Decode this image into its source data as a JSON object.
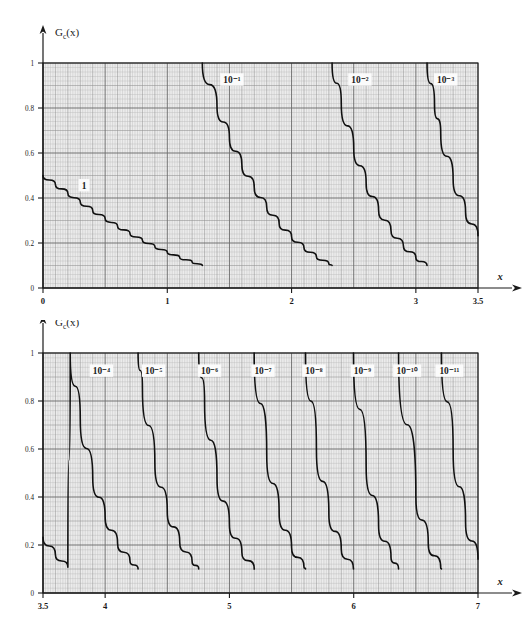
{
  "figure": {
    "kind": "nomogram",
    "background_color": "#ffffff",
    "ink_color": "#1a1a1a",
    "grid_minor_color": "#b9b9b9",
    "grid_major_color": "#6e6e6e",
    "grid_fill_color": "#ececec",
    "curve_color": "#101010",
    "axis_color": "#1a1a1a"
  },
  "panels": [
    {
      "id": "top-panel",
      "y_axis_label": "G",
      "y_axis_label_sub": "c",
      "y_axis_label_tail": "(x)",
      "x_axis_label": "x",
      "x_ticks": [
        "0",
        "1",
        "2",
        "3",
        "3.5"
      ],
      "x_tick_values": [
        0,
        1,
        2,
        3,
        3.5
      ],
      "y_ticks": [
        "0",
        "0.2",
        "0.4",
        "0.6",
        "0.8",
        "1"
      ],
      "y_tick_values": [
        0,
        0.2,
        0.4,
        0.6,
        0.8,
        1
      ],
      "x_range": [
        0,
        3.5
      ],
      "y_range": [
        0,
        1
      ],
      "curve_labels": [
        "1",
        "10⁻¹",
        "10⁻²",
        "10⁻³"
      ],
      "curve_exponents": [
        0,
        -1,
        -2,
        -3
      ]
    },
    {
      "id": "bottom-panel",
      "y_axis_label": "G",
      "y_axis_label_sub": "c",
      "y_axis_label_tail": "(x)",
      "x_axis_label": "x",
      "x_ticks": [
        "3.5",
        "4",
        "5",
        "6",
        "7"
      ],
      "x_tick_values": [
        3.5,
        4,
        5,
        6,
        7
      ],
      "y_ticks": [
        "0",
        "0.2",
        "0.4",
        "0.6",
        "0.8",
        "1"
      ],
      "y_tick_values": [
        0,
        0.2,
        0.4,
        0.6,
        0.8,
        1
      ],
      "x_range": [
        3.5,
        7
      ],
      "y_range": [
        0,
        1
      ],
      "curve_labels": [
        "10⁻⁴",
        "10⁻⁵",
        "10⁻⁶",
        "10⁻⁷",
        "10⁻⁸",
        "10⁻⁹",
        "10⁻¹⁰",
        "10⁻¹¹"
      ],
      "curve_exponents": [
        -4,
        -5,
        -6,
        -7,
        -8,
        -9,
        -10,
        -11
      ]
    }
  ],
  "chart_data": {
    "type": "line",
    "title": "",
    "xlabel": "x",
    "ylabel": "Gc(x)",
    "grid": true,
    "legend_position": "inline-on-curve",
    "panels": [
      {
        "id": "top-panel",
        "xlim": [
          0,
          3.5
        ],
        "ylim": [
          0,
          1
        ],
        "xticks": [
          0,
          1,
          2,
          3,
          3.5
        ],
        "yticks": [
          0,
          0.2,
          0.4,
          0.6,
          0.8,
          1
        ],
        "series": [
          {
            "name": "1",
            "exponent": 0,
            "label_x": 0.33,
            "label_y": 0.455,
            "points": [
              {
                "x": 0.0,
                "y": 0.5
              },
              {
                "x": 0.1,
                "y": 0.46
              },
              {
                "x": 0.2,
                "y": 0.4207
              },
              {
                "x": 0.3,
                "y": 0.3821
              },
              {
                "x": 0.4,
                "y": 0.3446
              },
              {
                "x": 0.5,
                "y": 0.3085
              },
              {
                "x": 0.6,
                "y": 0.2743
              },
              {
                "x": 0.7,
                "y": 0.242
              },
              {
                "x": 0.8,
                "y": 0.2119
              },
              {
                "x": 0.9,
                "y": 0.1841
              },
              {
                "x": 1.0,
                "y": 0.1587
              },
              {
                "x": 1.1,
                "y": 0.1357
              },
              {
                "x": 1.2,
                "y": 0.1151
              },
              {
                "x": 1.282,
                "y": 0.1
              }
            ]
          },
          {
            "name": "10^-1",
            "exponent": -1,
            "label_x": 1.52,
            "label_y": 0.925,
            "points": [
              {
                "x": 1.282,
                "y": 1.0
              },
              {
                "x": 1.4,
                "y": 0.8076
              },
              {
                "x": 1.5,
                "y": 0.6681
              },
              {
                "x": 1.6,
                "y": 0.548
              },
              {
                "x": 1.7,
                "y": 0.4457
              },
              {
                "x": 1.8,
                "y": 0.3593
              },
              {
                "x": 1.9,
                "y": 0.2872
              },
              {
                "x": 2.0,
                "y": 0.2275
              },
              {
                "x": 2.1,
                "y": 0.1786
              },
              {
                "x": 2.2,
                "y": 0.139
              },
              {
                "x": 2.3,
                "y": 0.1072
              },
              {
                "x": 2.326,
                "y": 0.1
              }
            ]
          },
          {
            "name": "10^-2",
            "exponent": -2,
            "label_x": 2.55,
            "label_y": 0.925,
            "points": [
              {
                "x": 2.326,
                "y": 1.0
              },
              {
                "x": 2.4,
                "y": 0.8198
              },
              {
                "x": 2.5,
                "y": 0.621
              },
              {
                "x": 2.6,
                "y": 0.4661
              },
              {
                "x": 2.7,
                "y": 0.3467
              },
              {
                "x": 2.8,
                "y": 0.2555
              },
              {
                "x": 2.9,
                "y": 0.1866
              },
              {
                "x": 3.0,
                "y": 0.135
              },
              {
                "x": 3.09,
                "y": 0.1
              }
            ]
          },
          {
            "name": "10^-3",
            "exponent": -3,
            "label_x": 3.24,
            "label_y": 0.925,
            "points": [
              {
                "x": 3.09,
                "y": 1.0
              },
              {
                "x": 3.15,
                "y": 0.8164
              },
              {
                "x": 3.2,
                "y": 0.6871
              },
              {
                "x": 3.3,
                "y": 0.4834
              },
              {
                "x": 3.4,
                "y": 0.3369
              },
              {
                "x": 3.5,
                "y": 0.2326
              }
            ]
          }
        ]
      },
      {
        "id": "bottom-panel",
        "xlim": [
          3.5,
          7
        ],
        "ylim": [
          0,
          1
        ],
        "xticks": [
          3.5,
          4,
          5,
          6,
          7
        ],
        "yticks": [
          0,
          0.2,
          0.4,
          0.6,
          0.8,
          1
        ],
        "series": [
          {
            "name": "10^-4",
            "exponent": -4,
            "label_x": 3.97,
            "label_y": 0.925,
            "points": [
              {
                "x": 3.5,
                "y": 0.2326
              },
              {
                "x": 3.6,
                "y": 0.1591
              },
              {
                "x": 3.7,
                "y": 0.1078
              },
              {
                "x": 3.719,
                "y": 1.0
              },
              {
                "x": 3.8,
                "y": 0.7235
              },
              {
                "x": 3.9,
                "y": 0.481
              },
              {
                "x": 4.0,
                "y": 0.3167
              },
              {
                "x": 4.1,
                "y": 0.2066
              },
              {
                "x": 4.2,
                "y": 0.1335
              },
              {
                "x": 4.265,
                "y": 0.1
              }
            ]
          },
          {
            "name": "10^-5",
            "exponent": -5,
            "label_x": 4.39,
            "label_y": 0.925,
            "points": [
              {
                "x": 4.265,
                "y": 1.0
              },
              {
                "x": 4.3,
                "y": 0.854
              },
              {
                "x": 4.4,
                "y": 0.5413
              },
              {
                "x": 4.5,
                "y": 0.3398
              },
              {
                "x": 4.6,
                "y": 0.2112
              },
              {
                "x": 4.7,
                "y": 0.1301
              },
              {
                "x": 4.753,
                "y": 0.1
              }
            ]
          },
          {
            "name": "10^-6",
            "exponent": -6,
            "label_x": 4.84,
            "label_y": 0.925,
            "points": [
              {
                "x": 4.753,
                "y": 1.0
              },
              {
                "x": 4.8,
                "y": 0.7933
              },
              {
                "x": 4.9,
                "y": 0.4792
              },
              {
                "x": 5.0,
                "y": 0.2867
              },
              {
                "x": 5.1,
                "y": 0.1698
              },
              {
                "x": 5.2,
                "y": 0.0996
              },
              {
                "x": 5.199,
                "y": 0.1
              }
            ]
          },
          {
            "name": "10^-7",
            "exponent": -7,
            "label_x": 5.27,
            "label_y": 0.925,
            "points": [
              {
                "x": 5.199,
                "y": 1.0
              },
              {
                "x": 5.3,
                "y": 0.579
              },
              {
                "x": 5.4,
                "y": 0.3332
              },
              {
                "x": 5.5,
                "y": 0.1899
              },
              {
                "x": 5.6,
                "y": 0.1072
              },
              {
                "x": 5.612,
                "y": 0.1
              }
            ]
          },
          {
            "name": "10^-8",
            "exponent": -8,
            "label_x": 5.68,
            "label_y": 0.925,
            "points": [
              {
                "x": 5.612,
                "y": 1.0
              },
              {
                "x": 5.7,
                "y": 0.599
              },
              {
                "x": 5.8,
                "y": 0.3316
              },
              {
                "x": 5.9,
                "y": 0.1818
              },
              {
                "x": 5.998,
                "y": 0.1
              }
            ]
          },
          {
            "name": "10^-9",
            "exponent": -9,
            "label_x": 6.07,
            "label_y": 0.925,
            "points": [
              {
                "x": 5.998,
                "y": 1.0
              },
              {
                "x": 6.1,
                "y": 0.5303
              },
              {
                "x": 6.2,
                "y": 0.2823
              },
              {
                "x": 6.3,
                "y": 0.1488
              },
              {
                "x": 6.361,
                "y": 0.1
              }
            ]
          },
          {
            "name": "10^-10",
            "exponent": -10,
            "label_x": 6.43,
            "label_y": 0.925,
            "points": [
              {
                "x": 6.361,
                "y": 1.0
              },
              {
                "x": 6.5,
                "y": 0.4016
              },
              {
                "x": 6.6,
                "y": 0.2056
              },
              {
                "x": 6.7,
                "y": 0.1042
              },
              {
                "x": 6.706,
                "y": 0.1
              }
            ]
          },
          {
            "name": "10^-11",
            "exponent": -11,
            "label_x": 6.77,
            "label_y": 0.925,
            "points": [
              {
                "x": 6.706,
                "y": 1.0
              },
              {
                "x": 6.8,
                "y": 0.5931
              },
              {
                "x": 6.9,
                "y": 0.2925
              },
              {
                "x": 7.0,
                "y": 0.1411
              }
            ]
          }
        ]
      }
    ]
  }
}
